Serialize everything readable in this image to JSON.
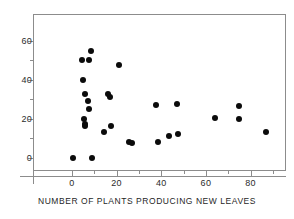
{
  "chart_data": {
    "type": "scatter",
    "title": "",
    "xlabel": "NUMBER OF PLANTS PRODUCING NEW LEAVES",
    "ylabel": "",
    "xlim": [
      -6,
      99
    ],
    "ylim": [
      -9,
      64
    ],
    "grid": false,
    "legend": null,
    "marker": {
      "shape": "circle",
      "color": "#0b0b0b",
      "size": 6
    },
    "x_ticks_major": [
      0,
      20,
      40,
      60,
      80
    ],
    "x_ticks_minor": [
      10,
      30,
      50,
      70,
      90
    ],
    "y_ticks_major": [
      0,
      20,
      40,
      60
    ],
    "y_ticks_minor": [
      10,
      30,
      50
    ],
    "x_tick_labels": [
      "0",
      "20",
      "40",
      "60",
      "80"
    ],
    "y_tick_labels": [
      "0",
      "20",
      "40",
      "60"
    ],
    "points": [
      {
        "x": 0.5,
        "y": 0
      },
      {
        "x": 9,
        "y": 0
      },
      {
        "x": 4.5,
        "y": 50
      },
      {
        "x": 7.5,
        "y": 50
      },
      {
        "x": 8.5,
        "y": 55
      },
      {
        "x": 5,
        "y": 40
      },
      {
        "x": 6,
        "y": 33
      },
      {
        "x": 7,
        "y": 29
      },
      {
        "x": 7.5,
        "y": 25
      },
      {
        "x": 5.5,
        "y": 20
      },
      {
        "x": 6,
        "y": 17.5
      },
      {
        "x": 6,
        "y": 16.5
      },
      {
        "x": 14.5,
        "y": 13.5
      },
      {
        "x": 16,
        "y": 33
      },
      {
        "x": 17,
        "y": 31.5
      },
      {
        "x": 17.5,
        "y": 16.5
      },
      {
        "x": 21,
        "y": 47.5
      },
      {
        "x": 25.5,
        "y": 8
      },
      {
        "x": 27,
        "y": 7.5
      },
      {
        "x": 37.5,
        "y": 27
      },
      {
        "x": 38.5,
        "y": 8
      },
      {
        "x": 43.5,
        "y": 11.5
      },
      {
        "x": 47,
        "y": 27.5
      },
      {
        "x": 47.5,
        "y": 12.5
      },
      {
        "x": 64,
        "y": 20.5
      },
      {
        "x": 75,
        "y": 26.5
      },
      {
        "x": 75,
        "y": 20
      },
      {
        "x": 87,
        "y": 13.5
      }
    ]
  },
  "axis": {
    "x_title": "NUMBER OF PLANTS PRODUCING NEW LEAVES"
  }
}
